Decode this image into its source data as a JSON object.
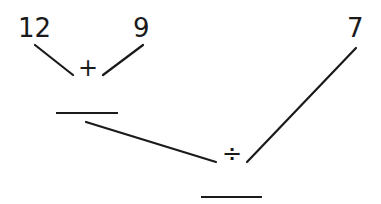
{
  "diagram": {
    "operands": {
      "a": "12",
      "b": "9",
      "c": "7"
    },
    "operators": {
      "first": "+",
      "second": "÷"
    },
    "blanks": [
      "",
      ""
    ],
    "line_color": "#1a1a1a"
  }
}
